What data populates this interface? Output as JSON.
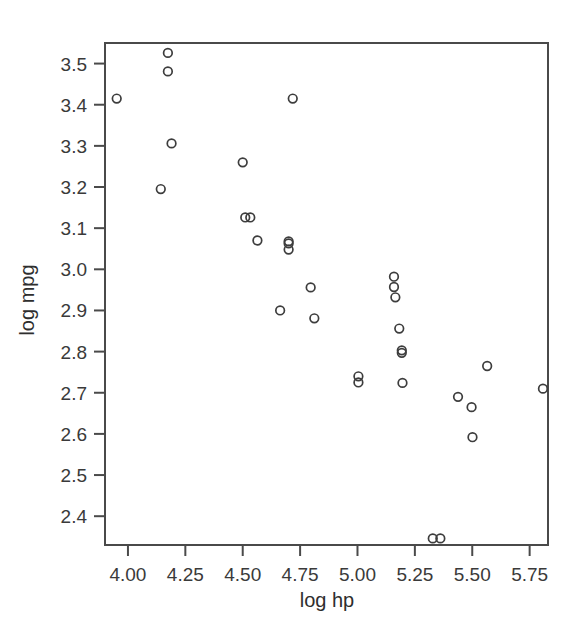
{
  "chart_data": {
    "type": "scatter",
    "title": "",
    "xlabel": "log hp",
    "ylabel": "log mpg",
    "xlim": [
      3.9,
      5.83
    ],
    "ylim": [
      2.33,
      3.55
    ],
    "grid": false,
    "legend": false,
    "marker": "open-circle",
    "marker_color": "#3d3d3d",
    "xticks": [
      4.0,
      4.25,
      4.5,
      4.75,
      5.0,
      5.25,
      5.5,
      5.75
    ],
    "xticklabels": [
      "4.00",
      "4.25",
      "4.50",
      "4.75",
      "5.00",
      "5.25",
      "5.50",
      "5.75"
    ],
    "yticks": [
      2.4,
      2.5,
      2.6,
      2.7,
      2.8,
      2.9,
      3.0,
      3.1,
      3.2,
      3.3,
      3.4,
      3.5
    ],
    "yticklabels": [
      "2.4",
      "2.5",
      "2.6",
      "2.7",
      "2.8",
      "2.9",
      "3.0",
      "3.1",
      "3.2",
      "3.3",
      "3.4",
      "3.5"
    ],
    "n_points": 32,
    "points": [
      {
        "x": 3.951,
        "y": 3.415
      },
      {
        "x": 4.143,
        "y": 3.195
      },
      {
        "x": 4.174,
        "y": 3.526
      },
      {
        "x": 4.174,
        "y": 3.481
      },
      {
        "x": 4.19,
        "y": 3.306
      },
      {
        "x": 4.5,
        "y": 3.26
      },
      {
        "x": 4.511,
        "y": 3.126
      },
      {
        "x": 4.533,
        "y": 3.126
      },
      {
        "x": 4.564,
        "y": 3.07
      },
      {
        "x": 4.663,
        "y": 2.9
      },
      {
        "x": 4.7,
        "y": 3.068
      },
      {
        "x": 4.7,
        "y": 3.063
      },
      {
        "x": 4.7,
        "y": 3.048
      },
      {
        "x": 4.718,
        "y": 3.415
      },
      {
        "x": 4.796,
        "y": 2.956
      },
      {
        "x": 4.812,
        "y": 2.881
      },
      {
        "x": 5.004,
        "y": 2.74
      },
      {
        "x": 5.004,
        "y": 2.725
      },
      {
        "x": 5.159,
        "y": 2.982
      },
      {
        "x": 5.159,
        "y": 2.957
      },
      {
        "x": 5.165,
        "y": 2.932
      },
      {
        "x": 5.182,
        "y": 2.856
      },
      {
        "x": 5.193,
        "y": 2.803
      },
      {
        "x": 5.193,
        "y": 2.797
      },
      {
        "x": 5.196,
        "y": 2.724
      },
      {
        "x": 5.328,
        "y": 2.346
      },
      {
        "x": 5.361,
        "y": 2.346
      },
      {
        "x": 5.438,
        "y": 2.69
      },
      {
        "x": 5.497,
        "y": 2.665
      },
      {
        "x": 5.501,
        "y": 2.592
      },
      {
        "x": 5.565,
        "y": 2.765
      },
      {
        "x": 5.808,
        "y": 2.71
      }
    ]
  },
  "axes": {
    "x_axis_name": "log hp",
    "y_axis_name": "log mpg"
  }
}
